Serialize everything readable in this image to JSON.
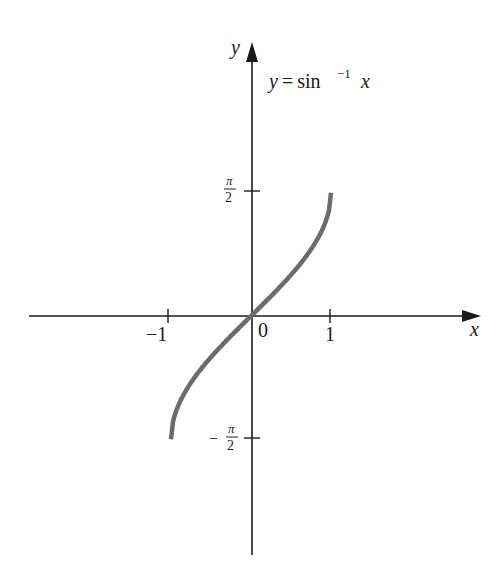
{
  "chart_data": {
    "type": "line",
    "function_label": {
      "lhs": "y = sin",
      "exponent": "−1",
      "rhs": "x"
    },
    "xlabel": "x",
    "ylabel": "y",
    "x_ticks": [
      {
        "value": -1,
        "label": "−1"
      },
      {
        "value": 1,
        "label": "1"
      }
    ],
    "origin_label": "0",
    "y_ticks": [
      {
        "value": 1.5708,
        "label_num": "π",
        "label_den": "2",
        "sign": ""
      },
      {
        "value": -1.5708,
        "label_num": "π",
        "label_den": "2",
        "sign": "−"
      }
    ],
    "xlim": [
      -2.7,
      2.8
    ],
    "ylim": [
      -3.0,
      3.4
    ],
    "grid": false,
    "legend": "none",
    "series": [
      {
        "name": "arcsin",
        "color": "#6b6b6b",
        "domain": [
          -1,
          1
        ],
        "x": [
          -1,
          -0.9,
          -0.75,
          -0.5,
          -0.25,
          0,
          0.25,
          0.5,
          0.75,
          0.9,
          1
        ],
        "y": [
          -1.5708,
          -1.1198,
          -0.8481,
          -0.5236,
          -0.2527,
          0,
          0.2527,
          0.5236,
          0.8481,
          1.1198,
          1.5708
        ]
      }
    ],
    "colors": {
      "axes": "#1a1a1a",
      "curve": "#6b6b6b",
      "background": "#ffffff"
    }
  }
}
